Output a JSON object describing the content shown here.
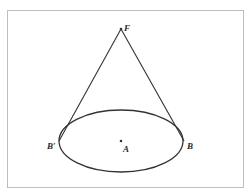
{
  "diagram": {
    "type": "cone-geometry",
    "colors": {
      "stroke": "#333333",
      "frame": "#bdbdbd",
      "background": "#ffffff"
    },
    "points": {
      "F": {
        "label": "F",
        "x": 121,
        "y": 29
      },
      "A": {
        "label": "A",
        "x": 121,
        "y": 141
      },
      "B": {
        "label": "B",
        "x": 184,
        "y": 141
      },
      "B_prime": {
        "label": "B′",
        "x": 59,
        "y": 141
      }
    },
    "ellipse": {
      "cx": 121,
      "cy": 141,
      "rx": 62,
      "ry": 31
    },
    "segments": [
      {
        "from": "F",
        "to": "B"
      },
      {
        "from": "F",
        "to": "B_prime"
      }
    ]
  }
}
